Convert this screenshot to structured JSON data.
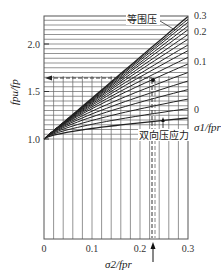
{
  "chart_data": {
    "type": "line",
    "title": "",
    "xlabel": "σ2/fpr",
    "ylabel": "fpu/fp",
    "right_axis_label": "σ1/fpr",
    "xlim": [
      0,
      0.3
    ],
    "ylim": [
      0.75,
      2.3
    ],
    "x_ticks": [
      "0",
      "0.1",
      "0.2",
      "0.3"
    ],
    "y_ticks": [
      "1.0",
      "1.5",
      "2.0"
    ],
    "right_ticks": [
      "0.3",
      "0.2",
      "0.1",
      "0"
    ],
    "grid": true,
    "annotations": [
      {
        "text": "等围压",
        "points_to": "top curve (equal confining pressure)"
      },
      {
        "text": "双向压应力",
        "points_to": "biaxial compressive stress curve (σ1/fpr = 0)"
      }
    ],
    "reference_lines": {
      "horizontal_dashed_y": 1.65,
      "vertical_dashed_x": 0.225,
      "marker_point": [
        0.225,
        1.63
      ]
    },
    "series": [
      {
        "name": "σ1/fpr = 0",
        "x": [
          0,
          0.1,
          0.2,
          0.3
        ],
        "y": [
          1.0,
          1.12,
          1.18,
          1.22
        ]
      },
      {
        "name": "σ1/fpr = 0.1",
        "x": [
          0,
          0.1,
          0.2,
          0.3
        ],
        "y": [
          1.0,
          1.45,
          1.66,
          1.79
        ]
      },
      {
        "name": "σ1/fpr = 0.2",
        "x": [
          0,
          0.1,
          0.2,
          0.3
        ],
        "y": [
          1.0,
          1.58,
          1.92,
          2.13
        ]
      },
      {
        "name": "σ1/fpr = 0.3 (等围压)",
        "x": [
          0,
          0.1,
          0.2,
          0.3
        ],
        "y": [
          1.0,
          1.65,
          2.02,
          2.29
        ]
      }
    ]
  },
  "labels": {
    "equal_pressure": "等围压",
    "biaxial": "双向压应力",
    "y_axis": "fpu/fp",
    "x_axis": "σ2/fpr",
    "right_axis": "σ1/fpr"
  }
}
